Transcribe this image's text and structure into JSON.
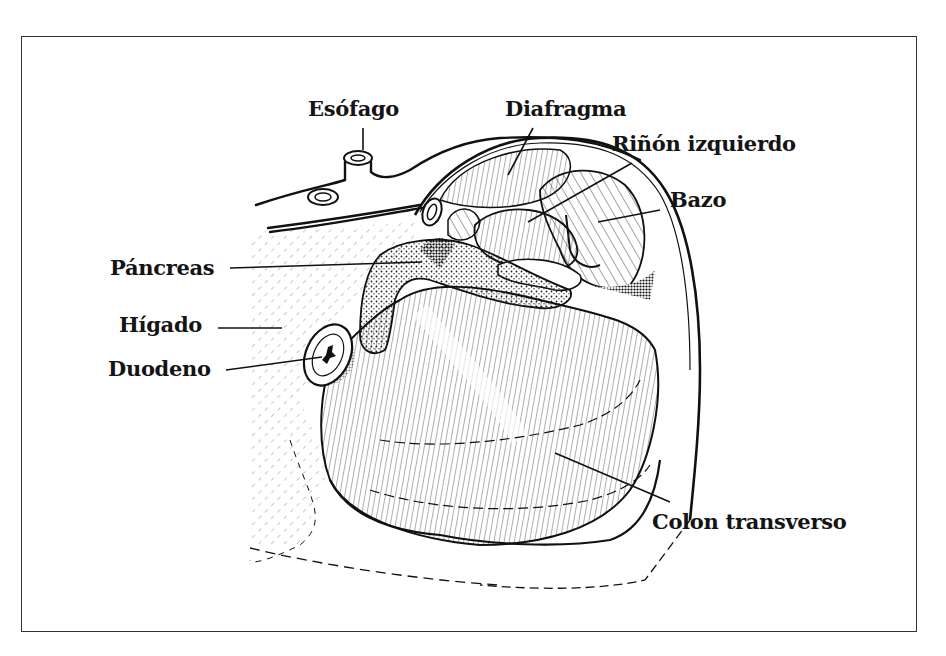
{
  "figure": {
    "labels": {
      "esofago": "Esófago",
      "diafragma": "Diafragma",
      "rinon": "Riñón izquierdo",
      "bazo": "Bazo",
      "pancreas": "Páncreas",
      "higado": "Hígado",
      "duodeno": "Duodeno",
      "colon": "Colon transverso"
    }
  }
}
